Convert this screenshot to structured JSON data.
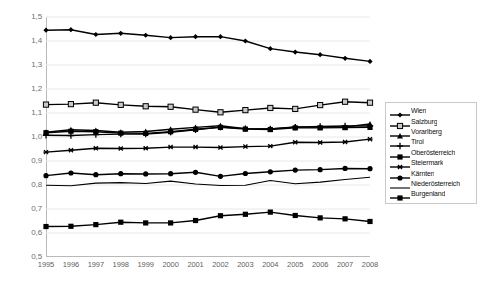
{
  "chart_data": {
    "type": "line",
    "title": "",
    "xlabel": "",
    "ylabel": "",
    "x": [
      1995,
      1996,
      1997,
      1998,
      1999,
      2000,
      2001,
      2002,
      2003,
      2004,
      2005,
      2006,
      2007,
      2008
    ],
    "x_tick_labels": [
      "1995",
      "1996",
      "1997",
      "1998",
      "1999",
      "2000",
      "2001",
      "2002",
      "2003",
      "2004",
      "2005",
      "2006",
      "2007",
      "2008"
    ],
    "y_tick_labels": [
      "1,5",
      "1,4",
      "1,3",
      "1,2",
      "1,1",
      "1,0",
      "0,9",
      "0,8",
      "0,7",
      "0,6",
      "0,5"
    ],
    "y_tick_values": [
      1.5,
      1.4,
      1.3,
      1.2,
      1.1,
      1.0,
      0.9,
      0.8,
      0.7,
      0.6,
      0.5
    ],
    "ylim": [
      0.5,
      1.5
    ],
    "grid": "horizontal",
    "legend_position": "right",
    "axis_color": "#b9b9b9",
    "grid_color": "#e8e8e8",
    "line_color": "#000000",
    "series": [
      {
        "name": "Wien",
        "marker": "diamond",
        "values": [
          1.445,
          1.447,
          1.427,
          1.432,
          1.424,
          1.414,
          1.418,
          1.418,
          1.4,
          1.368,
          1.354,
          1.343,
          1.328,
          1.315
        ]
      },
      {
        "name": "Salzburg",
        "marker": "open-square",
        "values": [
          1.135,
          1.137,
          1.143,
          1.134,
          1.128,
          1.126,
          1.114,
          1.103,
          1.112,
          1.121,
          1.117,
          1.133,
          1.147,
          1.143
        ]
      },
      {
        "name": "Vorarlberg",
        "marker": "triangle",
        "values": [
          1.02,
          1.03,
          1.027,
          1.02,
          1.023,
          1.032,
          1.04,
          1.047,
          1.035,
          1.034,
          1.042,
          1.041,
          1.042,
          1.054
        ]
      },
      {
        "name": "Tirol",
        "marker": "plus",
        "values": [
          1.007,
          1.006,
          1.01,
          1.012,
          1.012,
          1.02,
          1.03,
          1.041,
          1.035,
          1.034,
          1.041,
          1.044,
          1.046,
          1.046
        ]
      },
      {
        "name": "Oberösterreich",
        "marker": "square",
        "values": [
          1.018,
          1.024,
          1.022,
          1.016,
          1.015,
          1.022,
          1.032,
          1.04,
          1.033,
          1.031,
          1.038,
          1.038,
          1.039,
          1.04
        ]
      },
      {
        "name": "Steiermark",
        "marker": "asterisk",
        "values": [
          0.937,
          0.945,
          0.953,
          0.952,
          0.953,
          0.958,
          0.958,
          0.956,
          0.96,
          0.962,
          0.978,
          0.977,
          0.979,
          0.991
        ]
      },
      {
        "name": "Kärnten",
        "marker": "circle",
        "values": [
          0.839,
          0.85,
          0.843,
          0.847,
          0.846,
          0.847,
          0.853,
          0.836,
          0.848,
          0.855,
          0.862,
          0.864,
          0.869,
          0.868
        ]
      },
      {
        "name": "Niederösterreich",
        "marker": "none",
        "values": [
          0.799,
          0.797,
          0.808,
          0.81,
          0.806,
          0.816,
          0.804,
          0.798,
          0.799,
          0.819,
          0.805,
          0.812,
          0.823,
          0.832
        ]
      },
      {
        "name": "Burgenland",
        "marker": "filled-square",
        "values": [
          0.627,
          0.628,
          0.635,
          0.645,
          0.642,
          0.642,
          0.652,
          0.672,
          0.678,
          0.687,
          0.673,
          0.663,
          0.659,
          0.648
        ]
      }
    ]
  }
}
